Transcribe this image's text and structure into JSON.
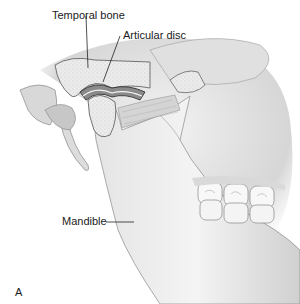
{
  "figure": {
    "panel_letter": "A",
    "labels": [
      {
        "id": "temporal-bone",
        "text": "Temporal bone"
      },
      {
        "id": "articular-disc",
        "text": "Articular disc"
      },
      {
        "id": "mandible",
        "text": "Mandible"
      }
    ]
  },
  "colors": {
    "background": "#ffffff",
    "bone_fill": "#ebebeb",
    "outline": "#555555",
    "shade": "#bdbdbd",
    "disc": "#8a8a8a",
    "text": "#1a1a1a"
  }
}
